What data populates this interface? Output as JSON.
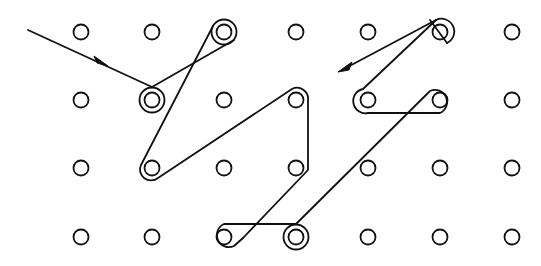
{
  "diagram": {
    "type": "dot-grid-path",
    "width": 541,
    "height": 266,
    "colors": {
      "background": "#ffffff",
      "ink": "#111111"
    },
    "grid": {
      "rows": 4,
      "cols": 7,
      "col_x": [
        81,
        152,
        224,
        296,
        368,
        440,
        512
      ],
      "row_y": [
        32,
        100,
        168,
        237
      ],
      "dot_radius": 7.5
    },
    "looped_dots": [
      {
        "col": 1,
        "row": 1,
        "style": "ring",
        "note": "entry loop"
      },
      {
        "col": 2,
        "row": 0,
        "style": "ring"
      },
      {
        "col": 1,
        "row": 2,
        "style": "wrap"
      },
      {
        "col": 3,
        "row": 1,
        "style": "wrap"
      },
      {
        "col": 3,
        "row": 3,
        "style": "ring"
      },
      {
        "col": 2,
        "row": 3,
        "style": "wrap"
      },
      {
        "col": 5,
        "row": 1,
        "style": "wrap"
      },
      {
        "col": 4,
        "row": 1,
        "style": "wrap"
      },
      {
        "col": 5,
        "row": 0,
        "style": "wrap"
      }
    ],
    "arrows": [
      {
        "name": "entry-arrow",
        "direction": "down-right",
        "position": [
          100,
          62
        ]
      },
      {
        "name": "exit-arrow",
        "direction": "down-left",
        "position": [
          343,
          70
        ]
      }
    ]
  }
}
